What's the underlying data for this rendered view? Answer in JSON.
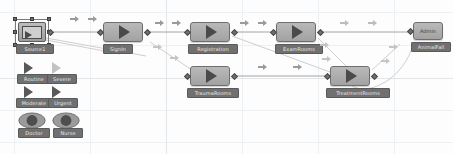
{
  "app": {
    "view": "process-flow-canvas",
    "background_color": "#fdfdfd",
    "grid_color": "#eceff1",
    "node_fill": "#b0b0b0",
    "node_border": "#6e6e6e",
    "label_bg": "#707070",
    "label_text_color": "#e9e9e9"
  },
  "nodes": [
    {
      "id": "source",
      "label": "Source1",
      "type": "source",
      "selected": true,
      "x": 18,
      "y": 22,
      "w": 28,
      "h": 20
    },
    {
      "id": "signin",
      "label": "SignIn",
      "type": "process",
      "selected": false,
      "x": 103,
      "y": 22,
      "w": 40,
      "h": 20
    },
    {
      "id": "registration",
      "label": "Registration",
      "type": "process",
      "selected": false,
      "x": 190,
      "y": 22,
      "w": 40,
      "h": 20
    },
    {
      "id": "examrooms",
      "label": "ExamRooms",
      "type": "process",
      "selected": false,
      "x": 276,
      "y": 22,
      "w": 40,
      "h": 20
    },
    {
      "id": "admin",
      "label": "AnimalFall",
      "type": "sink",
      "selected": false,
      "x": 413,
      "y": 22,
      "w": 30,
      "h": 18,
      "inner_text": "Admin"
    },
    {
      "id": "traumarooms",
      "label": "TraumaRooms",
      "type": "process",
      "selected": false,
      "x": 190,
      "y": 66,
      "w": 40,
      "h": 20
    },
    {
      "id": "treatmentrooms",
      "label": "TreatmentRooms",
      "type": "process",
      "selected": false,
      "x": 330,
      "y": 66,
      "w": 40,
      "h": 20
    }
  ],
  "palette": {
    "entity_types": [
      {
        "id": "routine",
        "label": "Routine",
        "x": 18,
        "y": 62,
        "icon": "play-arrow-icon",
        "dim": false
      },
      {
        "id": "severe",
        "label": "Severe",
        "x": 46,
        "y": 62,
        "icon": "play-arrow-icon",
        "dim": true
      },
      {
        "id": "moderate",
        "label": "Moderate",
        "x": 18,
        "y": 86,
        "icon": "play-arrow-icon",
        "dim": false
      },
      {
        "id": "urgent",
        "label": "Urgent",
        "x": 46,
        "y": 86,
        "icon": "play-arrow-icon",
        "dim": false
      }
    ],
    "resources": [
      {
        "id": "doctor",
        "label": "Doctor",
        "x": 18,
        "y": 112,
        "icon": "eye-resource-icon"
      },
      {
        "id": "nurse",
        "label": "Nurse",
        "x": 52,
        "y": 112,
        "icon": "eye-resource-icon"
      }
    ]
  },
  "flow_markers": [
    {
      "x": 70,
      "y": 16
    },
    {
      "x": 88,
      "y": 16
    },
    {
      "x": 155,
      "y": 20
    },
    {
      "x": 172,
      "y": 20
    },
    {
      "x": 240,
      "y": 20
    },
    {
      "x": 258,
      "y": 20
    },
    {
      "x": 340,
      "y": 20
    },
    {
      "x": 368,
      "y": 20
    },
    {
      "x": 258,
      "y": 64
    },
    {
      "x": 293,
      "y": 64
    },
    {
      "x": 320,
      "y": 42
    },
    {
      "x": 322,
      "y": 58
    },
    {
      "x": 389,
      "y": 44
    },
    {
      "x": 382,
      "y": 58
    },
    {
      "x": 153,
      "y": 44
    },
    {
      "x": 171,
      "y": 56
    }
  ],
  "links": [
    {
      "from": "source",
      "to": "signin"
    },
    {
      "from": "signin",
      "to": "registration"
    },
    {
      "from": "registration",
      "to": "examrooms"
    },
    {
      "from": "examrooms",
      "to": "admin"
    },
    {
      "from": "signin",
      "to": "traumarooms"
    },
    {
      "from": "traumarooms",
      "to": "treatmentrooms"
    },
    {
      "from": "examrooms",
      "to": "treatmentrooms"
    },
    {
      "from": "treatmentrooms",
      "to": "admin"
    },
    {
      "from": "source",
      "to": "traumarooms"
    }
  ]
}
